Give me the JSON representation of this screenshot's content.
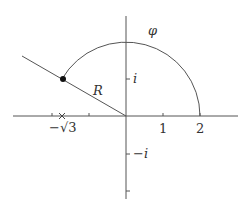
{
  "diagram": {
    "type": "complex-plane-contour",
    "labels": {
      "phi": "φ",
      "R": "R",
      "i": "i",
      "minus_i": "−i",
      "one": "1",
      "two": "2",
      "minus_sqrt3": "−√3"
    },
    "geometry": {
      "origin_px": [
        126,
        116
      ],
      "unit_px": 37,
      "arc_radius_units": 2,
      "arc_start_deg": 0,
      "arc_end_deg": 150,
      "ray_angle_deg": 150,
      "marked_point": "-sqrt(3)",
      "dot_point": "2·e^(i·5π/6)"
    },
    "colors": {
      "stroke": "#555555",
      "dot": "#111111",
      "text": "#333333"
    }
  }
}
